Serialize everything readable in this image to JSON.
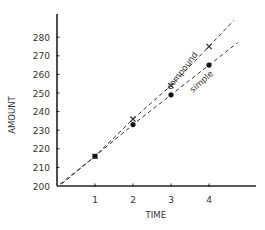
{
  "chart_data": {
    "type": "scatter",
    "title": "",
    "xlabel": "TIME",
    "ylabel": "AMOUNT",
    "xlim": [
      0,
      5.2
    ],
    "ylim": [
      200,
      285
    ],
    "x_ticks": [
      1,
      2,
      3,
      4
    ],
    "x_tick_labels": [
      "1",
      "2",
      "3",
      "4"
    ],
    "y_ticks": [
      200,
      210,
      220,
      230,
      240,
      250,
      260,
      270,
      280
    ],
    "y_tick_labels": [
      "200",
      "210",
      "220",
      "230",
      "240",
      "250",
      "260",
      "270",
      "280"
    ],
    "grid": false,
    "legend": "none (inline line labels)",
    "series": [
      {
        "name": "compound",
        "marker": "x",
        "line": "dashed",
        "x": [
          1,
          2,
          3,
          4
        ],
        "values": [
          216,
          236,
          254,
          275
        ],
        "label_annotation": "compound"
      },
      {
        "name": "simple",
        "marker": "filled-circle",
        "line": "dashed",
        "x": [
          1,
          2,
          3,
          4
        ],
        "values": [
          216,
          233,
          249,
          265
        ],
        "label_annotation": "simple"
      }
    ],
    "colors": {
      "axis": "#222222",
      "lines": "#333333",
      "text": "#333333"
    }
  }
}
